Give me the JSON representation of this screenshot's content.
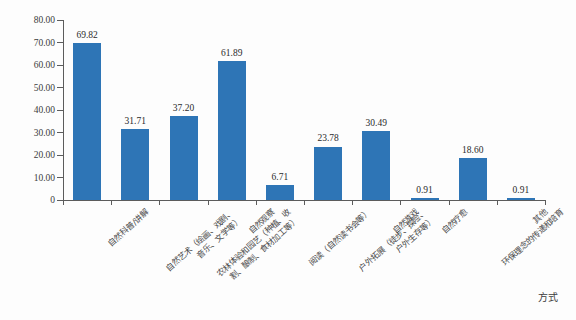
{
  "chart_data": {
    "type": "bar",
    "title": "",
    "xlabel": "方式",
    "ylabel": "百分比（%）",
    "ylim": [
      0,
      80
    ],
    "ytick_labels": [
      "0",
      "10.00",
      "20.00",
      "30.00",
      "40.00",
      "50.00",
      "60.00",
      "70.00",
      "80.00"
    ],
    "ytick_values": [
      0,
      10,
      20,
      30,
      40,
      50,
      60,
      70,
      80
    ],
    "grid": false,
    "legend": null,
    "bar_color": "#2e75b6",
    "categories": [
      "自然科普/讲解",
      "自然艺术（绘画、戏剧、音乐、文学等）",
      "农林体验和园艺（种植、收割、酿制、食材加工等）",
      "自然观察",
      "阅读（自然读书会等）",
      "户外拓展（徒步、探险、户外生存等）",
      "自然游戏",
      "自然疗愈",
      "环保理念的传递和培育",
      "其他"
    ],
    "category_lines": [
      [
        "自然科普/讲解"
      ],
      [
        "自然艺术（绘画、戏剧、",
        "音乐、文学等）"
      ],
      [
        "农林体验和园艺（种植、收",
        "割、酿制、食材加工等）"
      ],
      [
        "自然观察"
      ],
      [
        "阅读（自然读书会等）"
      ],
      [
        "户外拓展（徒步、探险、",
        "户外生存等）"
      ],
      [
        "自然游戏"
      ],
      [
        "自然疗愈"
      ],
      [
        "环保理念的传递和培育"
      ],
      [
        "其他"
      ]
    ],
    "values": [
      69.82,
      31.71,
      37.2,
      61.89,
      6.71,
      23.78,
      30.49,
      0.91,
      18.6,
      0.91
    ],
    "value_labels": [
      "69.82",
      "31.71",
      "37.20",
      "61.89",
      "6.71",
      "23.78",
      "30.49",
      "0.91",
      "18.60",
      "0.91"
    ]
  }
}
